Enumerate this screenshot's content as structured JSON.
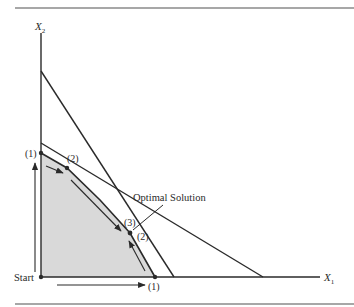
{
  "figure": {
    "axes": {
      "x_label": "X",
      "x_sub": "1",
      "y_label": "X",
      "y_sub": "2"
    },
    "labels": {
      "start": "Start",
      "optimal": "Optimal Solution",
      "vertex_y_axis": "(1)",
      "vertex_upper": "(2)",
      "vertex_x_axis": "(1)",
      "optimum_upper": "(3)",
      "optimum_right": "(2)"
    },
    "colors": {
      "ink": "#2a2a2a",
      "feasible_fill": "#d9d9d9",
      "rule": "#8a8a8a"
    }
  },
  "diagram": {
    "type": "linear-programming feasible region with simplex paths",
    "constraint_lines": [
      {
        "name": "steep",
        "from": [
          41,
          71
        ],
        "to": [
          173,
          277
        ]
      },
      {
        "name": "shallow",
        "from": [
          41,
          143
        ],
        "to": [
          263,
          277
        ]
      },
      {
        "name": "boundary",
        "points": [
          [
            41,
            153
          ],
          [
            67,
            168
          ],
          [
            130,
            233
          ],
          [
            155,
            277
          ]
        ]
      }
    ],
    "vertices": [
      "Start",
      "(1) on X2 axis",
      "(2)",
      "(3) optimal",
      "(2) optimal",
      "(1) on X1 axis"
    ],
    "paths": [
      "Start -> (1) up X2 axis -> (2) -> (3) optimal",
      "Start -> (1) along X1 axis -> (2) optimal"
    ]
  }
}
